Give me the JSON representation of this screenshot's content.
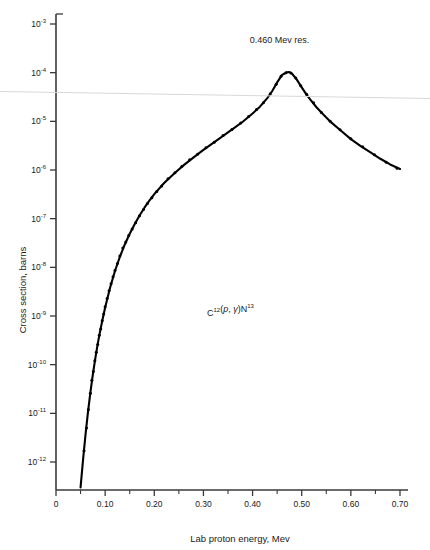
{
  "chart_data": {
    "type": "line",
    "title": "",
    "xlabel": "Lab proton energy, Mev",
    "ylabel": "Cross section, barns",
    "xlim": [
      0,
      0.7
    ],
    "ylim": [
      1e-12,
      0.001
    ],
    "yscale": "log",
    "xscale": "linear",
    "grid": false,
    "legend": null,
    "xticks": [
      0,
      0.1,
      0.2,
      0.3,
      0.4,
      0.5,
      0.6,
      0.7
    ],
    "xticklabels": [
      "0",
      "0.10",
      "0.20",
      "0.30",
      "0.40",
      "0.50",
      "0.60",
      "0.70"
    ],
    "xminorticks": [
      0.05,
      0.15,
      0.25,
      0.35,
      0.45,
      0.55,
      0.65
    ],
    "yticks": [
      0.001,
      0.0001,
      1e-05,
      1e-06,
      1e-07,
      1e-08,
      1e-09,
      1e-10,
      1e-11,
      1e-12
    ],
    "yticklabels": [
      {
        "mantissa": "10",
        "exponent": "-3"
      },
      {
        "mantissa": "10",
        "exponent": "-4"
      },
      {
        "mantissa": "10",
        "exponent": "-5"
      },
      {
        "mantissa": "10",
        "exponent": "-6"
      },
      {
        "mantissa": "10",
        "exponent": "-7"
      },
      {
        "mantissa": "10",
        "exponent": "-8"
      },
      {
        "mantissa": "10",
        "exponent": "-9"
      },
      {
        "mantissa": "10",
        "exponent": "-10"
      },
      {
        "mantissa": "10",
        "exponent": "-11"
      },
      {
        "mantissa": "10",
        "exponent": "-12"
      }
    ],
    "annotations": [
      {
        "name": "resonance-label",
        "text": "0.460 Mev res.",
        "x": 0.455,
        "y": 0.0004
      },
      {
        "name": "reaction-label",
        "parts": [
          {
            "text": "C",
            "style": "normal"
          },
          {
            "text": "12",
            "style": "super"
          },
          {
            "text": "(",
            "style": "normal"
          },
          {
            "text": "p",
            "style": "italic"
          },
          {
            "text": ", ",
            "style": "normal"
          },
          {
            "text": "γ",
            "style": "italic"
          },
          {
            "text": ")N",
            "style": "normal"
          },
          {
            "text": "13",
            "style": "super"
          }
        ],
        "plain_text": "C12(p, γ)N13",
        "x": 0.355,
        "y": 1e-09
      }
    ],
    "series": [
      {
        "name": "excitation-function-curve",
        "kind": "line",
        "color": "#000000",
        "points": [
          [
            0.05,
            3e-13
          ],
          [
            0.055,
            1.1e-12
          ],
          [
            0.06,
            3.6e-12
          ],
          [
            0.065,
            1.05e-11
          ],
          [
            0.07,
            2.7e-11
          ],
          [
            0.075,
            6.3e-11
          ],
          [
            0.08,
            1.35e-10
          ],
          [
            0.085,
            2.7e-10
          ],
          [
            0.09,
            5e-10
          ],
          [
            0.095,
            8.8e-10
          ],
          [
            0.1,
            1.5e-09
          ],
          [
            0.11,
            3.8e-09
          ],
          [
            0.12,
            8.4e-09
          ],
          [
            0.13,
            1.65e-08
          ],
          [
            0.14,
            2.95e-08
          ],
          [
            0.15,
            4.9e-08
          ],
          [
            0.16,
            7.7e-08
          ],
          [
            0.17,
            1.16e-07
          ],
          [
            0.18,
            1.68e-07
          ],
          [
            0.19,
            2.35e-07
          ],
          [
            0.2,
            3.2e-07
          ],
          [
            0.22,
            5.4e-07
          ],
          [
            0.24,
            8.4e-07
          ],
          [
            0.26,
            1.26e-06
          ],
          [
            0.28,
            1.82e-06
          ],
          [
            0.3,
            2.6e-06
          ],
          [
            0.32,
            3.6e-06
          ],
          [
            0.34,
            5e-06
          ],
          [
            0.36,
            7e-06
          ],
          [
            0.38,
            9.8e-06
          ],
          [
            0.4,
            1.45e-05
          ],
          [
            0.415,
            2e-05
          ],
          [
            0.43,
            3e-05
          ],
          [
            0.44,
            4.2e-05
          ],
          [
            0.45,
            6.3e-05
          ],
          [
            0.46,
            9e-05
          ],
          [
            0.47,
            0.000102
          ],
          [
            0.475,
            0.000103
          ],
          [
            0.48,
            9.6e-05
          ],
          [
            0.49,
            7.2e-05
          ],
          [
            0.5,
            5e-05
          ],
          [
            0.51,
            3.5e-05
          ],
          [
            0.52,
            2.6e-05
          ],
          [
            0.53,
            1.95e-05
          ],
          [
            0.545,
            1.35e-05
          ],
          [
            0.56,
            9.5e-06
          ],
          [
            0.58,
            6.4e-06
          ],
          [
            0.6,
            4.3e-06
          ],
          [
            0.62,
            3.1e-06
          ],
          [
            0.64,
            2.3e-06
          ],
          [
            0.66,
            1.7e-06
          ],
          [
            0.68,
            1.3e-06
          ],
          [
            0.7,
            1.05e-06
          ]
        ]
      },
      {
        "name": "measured-data-points",
        "kind": "scatter",
        "color": "#000000",
        "marker": "dot",
        "points": [
          [
            0.057,
            1.7e-12
          ],
          [
            0.062,
            5e-12
          ],
          [
            0.066,
            1.2e-11
          ],
          [
            0.07,
            2.6e-11
          ],
          [
            0.073,
            4.8e-11
          ],
          [
            0.076,
            7.2e-11
          ],
          [
            0.079,
            1.2e-10
          ],
          [
            0.082,
            1.8e-10
          ],
          [
            0.085,
            2.6e-10
          ],
          [
            0.088,
            4e-10
          ],
          [
            0.091,
            5.4e-10
          ],
          [
            0.094,
            8e-10
          ],
          [
            0.097,
            1.1e-09
          ],
          [
            0.1,
            1.55e-09
          ],
          [
            0.104,
            2.3e-09
          ],
          [
            0.108,
            3.3e-09
          ],
          [
            0.112,
            4.6e-09
          ],
          [
            0.116,
            6.4e-09
          ],
          [
            0.12,
            8.6e-09
          ],
          [
            0.125,
            1.2e-08
          ],
          [
            0.13,
            1.7e-08
          ],
          [
            0.136,
            2.5e-08
          ],
          [
            0.142,
            3.3e-08
          ],
          [
            0.148,
            4.5e-08
          ],
          [
            0.155,
            6.1e-08
          ],
          [
            0.162,
            8.2e-08
          ],
          [
            0.17,
            1.15e-07
          ],
          [
            0.178,
            1.55e-07
          ],
          [
            0.186,
            2.05e-07
          ],
          [
            0.195,
            2.7e-07
          ],
          [
            0.205,
            3.6e-07
          ],
          [
            0.215,
            4.7e-07
          ],
          [
            0.228,
            6.6e-07
          ],
          [
            0.242,
            8.8e-07
          ],
          [
            0.256,
            1.18e-06
          ],
          [
            0.272,
            1.62e-06
          ],
          [
            0.288,
            2.1e-06
          ],
          [
            0.305,
            2.85e-06
          ],
          [
            0.322,
            3.7e-06
          ],
          [
            0.34,
            5.1e-06
          ],
          [
            0.358,
            6.8e-06
          ],
          [
            0.376,
            9.2e-06
          ],
          [
            0.392,
            1.26e-05
          ],
          [
            0.408,
            1.75e-05
          ],
          [
            0.422,
            2.4e-05
          ],
          [
            0.436,
            3.7e-05
          ],
          [
            0.448,
            5.8e-05
          ],
          [
            0.458,
            8.4e-05
          ],
          [
            0.468,
            0.0001
          ],
          [
            0.478,
            9.9e-05
          ],
          [
            0.488,
            7.8e-05
          ],
          [
            0.498,
            5.4e-05
          ],
          [
            0.51,
            3.6e-05
          ],
          [
            0.524,
            2.4e-05
          ],
          [
            0.54,
            1.52e-05
          ],
          [
            0.558,
            1e-05
          ],
          [
            0.578,
            6.7e-06
          ],
          [
            0.6,
            4.4e-06
          ],
          [
            0.624,
            3e-06
          ],
          [
            0.648,
            2.05e-06
          ],
          [
            0.672,
            1.45e-06
          ],
          [
            0.694,
            1.08e-06
          ]
        ]
      }
    ]
  },
  "figure": {
    "axis_color": "#3a3a3a",
    "curve_color": "#000000",
    "background": "#ffffff"
  }
}
